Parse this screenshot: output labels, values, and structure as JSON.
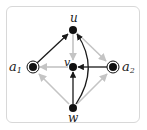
{
  "diagram": {
    "type": "directed-graph",
    "colors": {
      "dark_edge": "#1a1a1a",
      "light_edge": "#c4c4c4",
      "node": "#111111",
      "frame": "#d8d8d8"
    },
    "nodes": [
      {
        "id": "u",
        "label": "u",
        "x": 73,
        "y": 30,
        "style": "filled"
      },
      {
        "id": "v",
        "label": "v",
        "x": 73,
        "y": 67,
        "style": "filled"
      },
      {
        "id": "w",
        "label": "w",
        "x": 73,
        "y": 108,
        "style": "filled"
      },
      {
        "id": "a1",
        "label": "a",
        "sub": "1",
        "x": 33,
        "y": 67,
        "style": "double-circle"
      },
      {
        "id": "a2",
        "label": "a",
        "sub": "2",
        "x": 113,
        "y": 67,
        "style": "double-circle"
      }
    ],
    "edges": [
      {
        "from": "a1",
        "to": "u",
        "color": "dark"
      },
      {
        "from": "u",
        "to": "v",
        "color": "light"
      },
      {
        "from": "u",
        "to": "a2",
        "color": "light"
      },
      {
        "from": "v",
        "to": "a1",
        "color": "light"
      },
      {
        "from": "a2",
        "to": "v",
        "color": "dark"
      },
      {
        "from": "w",
        "to": "v",
        "color": "dark"
      },
      {
        "from": "w",
        "to": "u",
        "color": "dark",
        "curved": true
      },
      {
        "from": "w",
        "to": "a1",
        "color": "light"
      },
      {
        "from": "w",
        "to": "a2",
        "color": "light"
      }
    ]
  }
}
